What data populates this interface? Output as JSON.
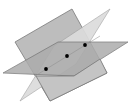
{
  "figure": {
    "colors": {
      "background": "#ffffff",
      "vertical_plane": "#b8b8b8",
      "light_plane": "#dadada",
      "horizontal_plane": "#a9a9a9",
      "edge": "#7a7a7a",
      "point": "#000000"
    },
    "points": [
      {
        "x": 46,
        "y": 69
      },
      {
        "x": 67,
        "y": 56
      },
      {
        "x": 85,
        "y": 45
      }
    ]
  }
}
